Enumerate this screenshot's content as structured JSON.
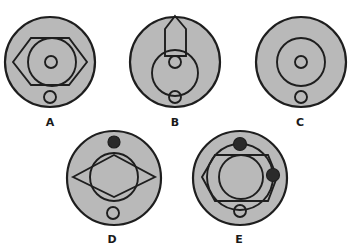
{
  "figure": {
    "background": "#ffffff",
    "disc_fill": "#b9b9b9",
    "stroke_color": "#1e1e1e",
    "options": [
      {
        "label": "A",
        "description": "Disc with hexagon enclosing a circle, small center circle, small circle at bottom"
      },
      {
        "label": "B",
        "description": "Disc with arrow-shaped pentagon at top over a circle, small center circle, small circle at bottom"
      },
      {
        "label": "C",
        "description": "Disc with concentric circle, small center circle, small circle at bottom"
      },
      {
        "label": "D",
        "description": "Disc with diamond over a circle, black dot at top, small circle at bottom"
      },
      {
        "label": "E",
        "description": "Disc with ring carrying two black dots, hexagon enclosing a circle, small circle with line at bottom"
      }
    ]
  }
}
